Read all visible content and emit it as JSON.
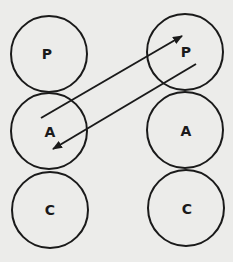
{
  "diagram": {
    "left_column": [
      {
        "label": "P",
        "cx": 49,
        "cy": 54
      },
      {
        "label": "A",
        "cx": 49,
        "cy": 131
      },
      {
        "label": "C",
        "cx": 50,
        "cy": 210
      }
    ],
    "right_column": [
      {
        "label": "P",
        "cx": 185,
        "cy": 52
      },
      {
        "label": "A",
        "cx": 185,
        "cy": 130
      },
      {
        "label": "C",
        "cx": 186,
        "cy": 208
      }
    ],
    "radius": 38,
    "arrows": [
      {
        "from": "left A",
        "to": "right P",
        "x1": 41,
        "y1": 118,
        "x2": 182,
        "y2": 36
      },
      {
        "from": "right P",
        "to": "left A",
        "x1": 196,
        "y1": 64,
        "x2": 53,
        "y2": 149
      }
    ],
    "stroke_color": "#1a1a1a",
    "background": "#ececea"
  }
}
